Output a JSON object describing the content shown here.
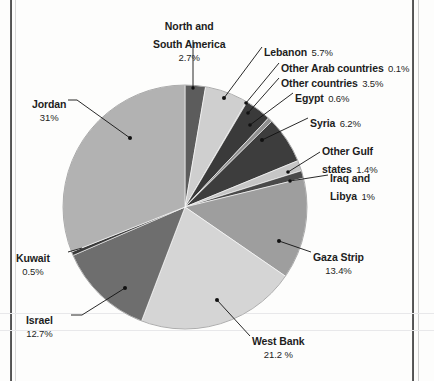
{
  "chart_data": {
    "type": "pie",
    "title": "",
    "subtitle": "",
    "xlabel": "",
    "ylabel": "",
    "legend_position": "callout-labels",
    "grid": false,
    "units": "percent",
    "categories": [
      "North and South America",
      "Lebanon",
      "Other Arab countries",
      "Other countries",
      "Egypt",
      "Syria",
      "Other Gulf states",
      "Iraq and Libya",
      "Gaza Strip",
      "West Bank",
      "Israel",
      "Kuwait",
      "Jordan"
    ],
    "values": [
      2.7,
      5.7,
      0.1,
      3.5,
      0.6,
      6.2,
      1.4,
      1.0,
      13.4,
      21.2,
      12.7,
      0.5,
      31.0
    ],
    "value_labels": [
      "2.7%",
      "5.7%",
      "0.1%",
      "3.5%",
      "0.6%",
      "6.2%",
      "1.4%",
      "1%",
      "13.4%",
      "21.2 %",
      "12.7%",
      "0.5%",
      "31%"
    ],
    "colors": [
      "#5c5c5c",
      "#cfcfcf",
      "#8f8f8f",
      "#3a3a3a",
      "#8f8f8f",
      "#3d3d3d",
      "#c6c6c6",
      "#4a4a4a",
      "#9e9e9e",
      "#d5d5d5",
      "#6e6e6e",
      "#3a3a3a",
      "#b2b2b2"
    ],
    "start_angle_deg": 0,
    "direction": "clockwise",
    "slices": [
      {
        "label": "North and South America",
        "value": 2.7,
        "value_label": "2.7%",
        "color": "#5c5c5c"
      },
      {
        "label": "Lebanon",
        "value": 5.7,
        "value_label": "5.7%",
        "color": "#cfcfcf"
      },
      {
        "label": "Other Arab countries",
        "value": 0.1,
        "value_label": "0.1%",
        "color": "#8f8f8f"
      },
      {
        "label": "Other countries",
        "value": 3.5,
        "value_label": "3.5%",
        "color": "#3a3a3a"
      },
      {
        "label": "Egypt",
        "value": 0.6,
        "value_label": "0.6%",
        "color": "#8f8f8f"
      },
      {
        "label": "Syria",
        "value": 6.2,
        "value_label": "6.2%",
        "color": "#3d3d3d"
      },
      {
        "label": "Other Gulf states",
        "value": 1.4,
        "value_label": "1.4%",
        "color": "#c6c6c6"
      },
      {
        "label": "Iraq and Libya",
        "value": 1.0,
        "value_label": "1%",
        "color": "#4a4a4a"
      },
      {
        "label": "Gaza Strip",
        "value": 13.4,
        "value_label": "13.4%",
        "color": "#9e9e9e"
      },
      {
        "label": "West Bank",
        "value": 21.2,
        "value_label": "21.2 %",
        "color": "#d5d5d5"
      },
      {
        "label": "Israel",
        "value": 12.7,
        "value_label": "12.7%",
        "color": "#6e6e6e"
      },
      {
        "label": "Kuwait",
        "value": 0.5,
        "value_label": "0.5%",
        "color": "#3a3a3a"
      },
      {
        "label": "Jordan",
        "value": 31.0,
        "value_label": "31%",
        "color": "#b2b2b2"
      }
    ]
  },
  "labels": {
    "north_south_america": {
      "name_line1": "North and",
      "name_line2": "South America",
      "percent": "2.7%"
    },
    "jordan": {
      "name": "Jordan",
      "percent": "31%"
    },
    "lebanon": {
      "name": "Lebanon",
      "percent": "5.7%"
    },
    "other_arab": {
      "name": "Other Arab countries",
      "percent": "0.1%"
    },
    "other_countries": {
      "name": "Other countries",
      "percent": "3.5%"
    },
    "egypt": {
      "name": "Egypt",
      "percent": "0.6%"
    },
    "syria": {
      "name": "Syria",
      "percent": "6.2%"
    },
    "other_gulf": {
      "name_line1": "Other Gulf",
      "name_line2": "states",
      "percent": "1.4%"
    },
    "iraq_libya": {
      "name_line1": "Iraq and",
      "name_line2": "Libya",
      "percent": "1%"
    },
    "gaza": {
      "name": "Gaza Strip",
      "percent": "13.4%"
    },
    "west_bank": {
      "name": "West Bank",
      "percent": "21.2 %"
    },
    "israel": {
      "name": "Israel",
      "percent": "12.7%"
    },
    "kuwait": {
      "name": "Kuwait",
      "percent": "0.5%"
    }
  }
}
